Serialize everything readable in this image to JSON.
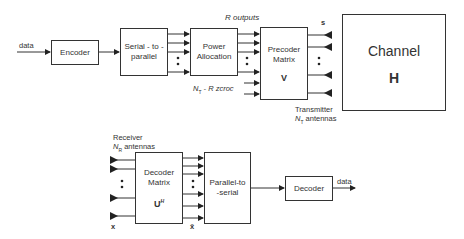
{
  "transmitter": {
    "input_label": "data",
    "encoder": "Encoder",
    "serial_to_parallel": [
      "Serial - to -",
      "parallel"
    ],
    "power_allocation": [
      "Power",
      "Allocation"
    ],
    "precoder": {
      "line1": "Precoder",
      "line2": "Matrix",
      "symbol": "V"
    },
    "r_outputs": "R outputs",
    "nt_minus_r": "N_T - R zeros",
    "nt_minus_r_display": {
      "n": "N",
      "sub": "T",
      "rest": " - R zcroc"
    },
    "output_symbol": "s",
    "antenna_label_1": "Transmitter",
    "antenna_label_2": {
      "n": "N",
      "sub": "T",
      "rest": " antennas"
    }
  },
  "channel": {
    "title": "Channel",
    "symbol": "H"
  },
  "receiver": {
    "antenna_label_1": "Receiver",
    "antenna_label_2": {
      "n": "N",
      "sub": "R",
      "rest": " antennas"
    },
    "input_symbol": "x",
    "decoder_matrix": {
      "line1": "Decoder",
      "line2": "Matrix",
      "symbol": "U",
      "sup": "H"
    },
    "output_symbol": "x̃",
    "parallel_to_serial": [
      "Parallel-to",
      "-serial"
    ],
    "decoder": "Decoder",
    "output_label": "data"
  }
}
